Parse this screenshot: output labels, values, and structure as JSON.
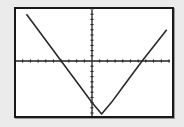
{
  "calculator_screen": {
    "mode": "graph",
    "window": {
      "xmin": -10,
      "xmax": 10,
      "xscl": 1,
      "ymin": -10,
      "ymax": 10,
      "yscl": 1
    },
    "colors": {
      "background": "#ebebeb",
      "screen": "#ffffff",
      "border": "#1a1a1a",
      "axes": "#222222",
      "plot": "#2a2a2a"
    }
  },
  "chart_data": {
    "type": "line",
    "title": "",
    "xlabel": "",
    "ylabel": "",
    "xlim": [
      -10,
      10
    ],
    "ylim": [
      -10,
      10
    ],
    "grid": false,
    "x_ticks_every": 1,
    "y_ticks_every": 1,
    "series": [
      {
        "name": "y = 2|x - 1.25| - 10.5 (approx.)",
        "x": [
          -8.5,
          -6,
          -4,
          -2,
          0,
          1.25,
          2.5,
          4,
          6.5,
          9.7
        ],
        "y": [
          9.0,
          4.0,
          0.0,
          -4.0,
          -8.0,
          -10.5,
          -8.0,
          -5.0,
          0.0,
          6.0
        ]
      }
    ],
    "annotations": [
      "V-shaped absolute-value graph; vertex just below bottom of window near x ≈ 1.25",
      "x-intercepts ≈ -4 and ≈ 6.5"
    ]
  }
}
